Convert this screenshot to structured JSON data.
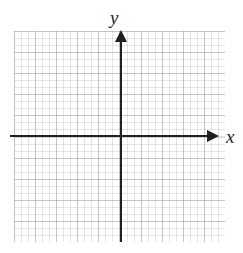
{
  "figure": {
    "type": "coordinate-plane",
    "title": "",
    "background_color": "#ffffff",
    "axis_color": "#231f20",
    "grid_minor_color": "#aaaaaf",
    "grid_major_color": "#96969b"
  },
  "grid": {
    "minor_cell_px": 7,
    "major_every_n_cells": 3,
    "minor_cells_horizontal": 30,
    "minor_cells_vertical": 30,
    "left_px": 14,
    "top_px": 31,
    "width_px": 211,
    "height_px": 211,
    "visible": true
  },
  "axes": {
    "origin": {
      "x_px": 121,
      "y_px": 136
    },
    "x": {
      "label": "x",
      "arrow": "right",
      "line_start_px": 10,
      "line_end_px": 219,
      "tick_labels": [],
      "range": [
        -15,
        15
      ]
    },
    "y": {
      "label": "y",
      "arrow": "up",
      "line_start_px": 30,
      "line_end_px": 242,
      "tick_labels": [],
      "range": [
        -15,
        15
      ]
    }
  },
  "chart_data": {
    "type": "scatter",
    "title": "",
    "xlabel": "x",
    "ylabel": "y",
    "x": [],
    "y": [],
    "series": [],
    "annotations": [],
    "xlim": [
      -15,
      15
    ],
    "ylim": [
      -15,
      15
    ],
    "grid": true,
    "legend": null,
    "xticks": [],
    "yticks": []
  }
}
